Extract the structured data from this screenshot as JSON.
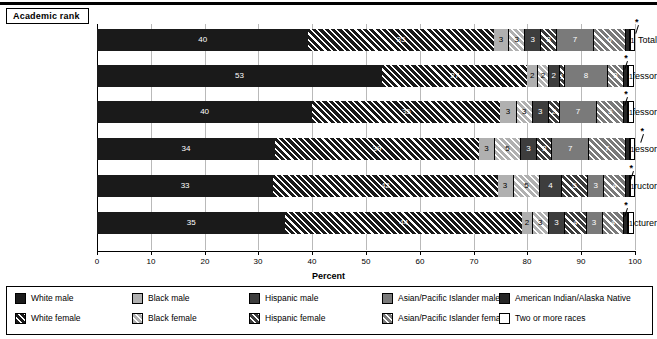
{
  "header": {
    "title": "Academic rank"
  },
  "axis": {
    "x_title": "Percent",
    "x_ticks": [
      "0",
      "10",
      "20",
      "30",
      "40",
      "50",
      "60",
      "70",
      "80",
      "90",
      "100"
    ],
    "x_min": 0,
    "x_max": 100
  },
  "legend": {
    "items": [
      {
        "label": "White male",
        "key": "wm"
      },
      {
        "label": "Black male",
        "key": "bm"
      },
      {
        "label": "Hispanic male",
        "key": "hm"
      },
      {
        "label": "Asian/Pacific Islander male",
        "key": "am"
      },
      {
        "label": "American Indian/Alaska Native",
        "key": "ai"
      },
      {
        "label": "White female",
        "key": "wf"
      },
      {
        "label": "Black female",
        "key": "bf"
      },
      {
        "label": "Hispanic female",
        "key": "hf"
      },
      {
        "label": "Asian/Pacific Islander female",
        "key": "af"
      },
      {
        "label": "Two or more races",
        "key": "tm"
      }
    ]
  },
  "footnote_marker": "*",
  "colors": {
    "white_male": "#1a1a1a",
    "black_male": "#b0b0b0",
    "hispanic_male": "#3d3d3d",
    "asian_male": "#7a7a7a",
    "american_indian": "#262626",
    "two_or_more": "#ffffff",
    "gridline": "#b9b9b9",
    "axis": "#000000"
  },
  "chart_data": {
    "type": "bar",
    "orientation": "horizontal",
    "stacked": true,
    "title": "Academic rank",
    "xlabel": "Percent",
    "ylabel": "",
    "xlim": [
      0,
      100
    ],
    "grid": true,
    "legend_position": "bottom",
    "categories": [
      "Total",
      "Professor",
      "Associate professor",
      "Assistant professor",
      "Instructor",
      "Lecturer"
    ],
    "series": [
      {
        "name": "White male",
        "key": "wm",
        "values": [
          40,
          53,
          40,
          34,
          33,
          35
        ]
      },
      {
        "name": "White female",
        "key": "wf",
        "values": [
          35,
          27,
          35,
          39,
          42,
          44
        ]
      },
      {
        "name": "Black male",
        "key": "bm",
        "values": [
          3,
          2,
          3,
          3,
          3,
          2
        ]
      },
      {
        "name": "Black female",
        "key": "bf",
        "values": [
          3,
          2,
          3,
          5,
          5,
          3
        ]
      },
      {
        "name": "Hispanic male",
        "key": "hm",
        "values": [
          3,
          2,
          3,
          3,
          4,
          3
        ]
      },
      {
        "name": "Hispanic female",
        "key": "hf",
        "values": [
          3,
          1,
          2,
          3,
          5,
          4
        ]
      },
      {
        "name": "Asian/Pacific Islander male",
        "key": "am",
        "values": [
          7,
          8,
          7,
          7,
          3,
          3
        ]
      },
      {
        "name": "Asian/Pacific Islander female",
        "key": "af",
        "values": [
          6,
          3,
          5,
          7,
          4,
          4
        ]
      },
      {
        "name": "American Indian/Alaska Native",
        "key": "ai",
        "values": [
          0,
          0,
          0,
          0,
          0,
          0
        ],
        "footnote": "*"
      },
      {
        "name": "Two or more races",
        "key": "tm",
        "values": [
          1,
          1,
          1,
          1,
          1,
          1
        ]
      }
    ]
  }
}
